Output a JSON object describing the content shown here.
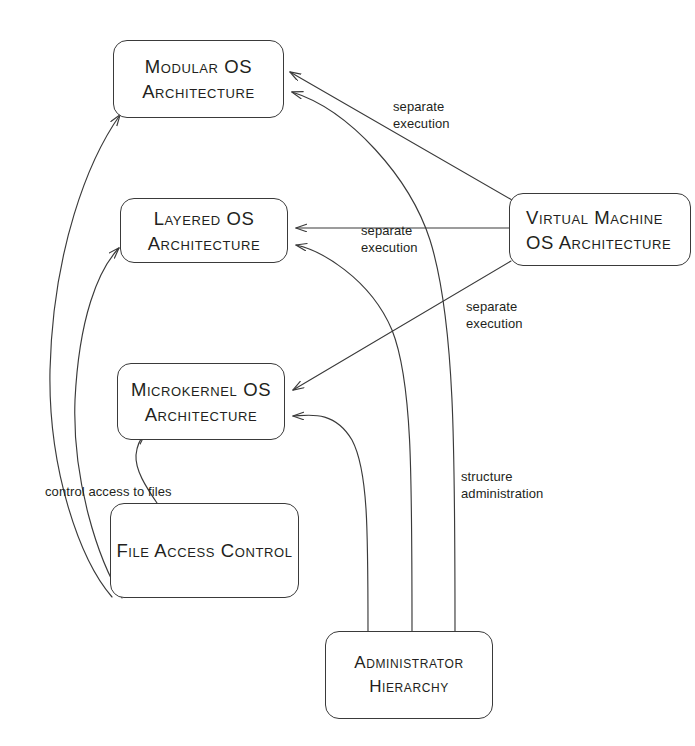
{
  "diagram": {
    "stroke_color": "#3a3a3a",
    "text_color": "#231f20",
    "background": "#ffffff",
    "nodes": [
      {
        "id": "modular",
        "lines": [
          "Modular OS",
          "Architecture"
        ]
      },
      {
        "id": "layered",
        "lines": [
          "Layered OS",
          "Architecture"
        ]
      },
      {
        "id": "microkernel",
        "lines": [
          "Microkernel OS",
          "Architecture"
        ]
      },
      {
        "id": "virtual_machine",
        "lines": [
          "Virtual Machine",
          "OS Architecture"
        ]
      },
      {
        "id": "file_access_control",
        "lines": [
          "File Access Control"
        ]
      },
      {
        "id": "administrator_hierarchy",
        "lines": [
          "Administrator",
          "Hierarchy"
        ]
      }
    ],
    "edge_labels": [
      {
        "id": "sep_top",
        "line1": "separate",
        "line2": "execution"
      },
      {
        "id": "sep_mid",
        "line1": "separate",
        "line2": "execution"
      },
      {
        "id": "sep_bot",
        "line1": "separate",
        "line2": "execution"
      },
      {
        "id": "structure_admin",
        "line1": "structure",
        "line2": "administration"
      },
      {
        "id": "control_access",
        "line1": "control access to files",
        "line2": ""
      }
    ],
    "edges": [
      {
        "from": "virtual_machine",
        "to": "modular",
        "label": "separate execution"
      },
      {
        "from": "virtual_machine",
        "to": "layered",
        "label": "separate execution"
      },
      {
        "from": "virtual_machine",
        "to": "microkernel",
        "label": "separate execution"
      },
      {
        "from": "administrator_hierarchy",
        "to": "modular",
        "label": "structure administration"
      },
      {
        "from": "administrator_hierarchy",
        "to": "layered",
        "label": "structure administration"
      },
      {
        "from": "administrator_hierarchy",
        "to": "microkernel",
        "label": "structure administration"
      },
      {
        "from": "file_access_control",
        "to": "modular",
        "label": "control access to files"
      },
      {
        "from": "file_access_control",
        "to": "layered",
        "label": "control access to files"
      },
      {
        "from": "file_access_control",
        "to": "microkernel",
        "label": "control access to files"
      }
    ]
  }
}
